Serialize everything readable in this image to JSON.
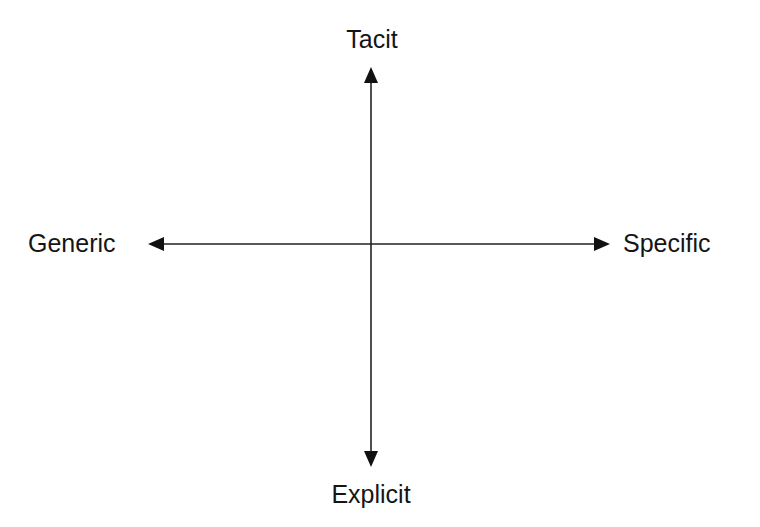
{
  "diagram": {
    "type": "quadrant-axes",
    "axes": {
      "vertical": {
        "top_label": "Tacit",
        "bottom_label": "Explicit"
      },
      "horizontal": {
        "left_label": "Generic",
        "right_label": "Specific"
      }
    },
    "colors": {
      "background": "#ffffff",
      "line": "#222222",
      "text": "#151515"
    }
  }
}
